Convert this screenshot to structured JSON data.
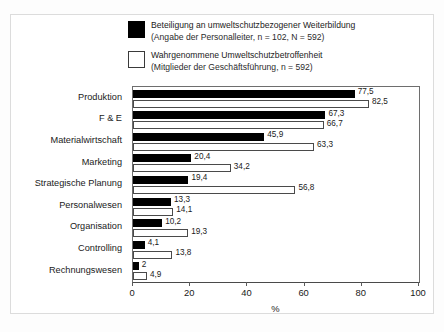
{
  "legend": {
    "items": [
      {
        "swatch": "black",
        "line1": "Beteiligung an umweltschutzbezogener Weiterbildung",
        "line2": "(Angabe der Personalleiter, n = 102, N = 592)"
      },
      {
        "swatch": "white",
        "line1": "Wahrgenommene Umweltschutzbetroffenheit",
        "line2": "(Mitglieder der Geschäftsführung, n = 592)"
      }
    ]
  },
  "chart_data": {
    "type": "bar",
    "orientation": "horizontal",
    "title": "",
    "subtitle": "",
    "xlabel": "%",
    "ylabel": "",
    "xlim": [
      0,
      100
    ],
    "xticks": [
      "0",
      "20",
      "40",
      "60",
      "80",
      "100"
    ],
    "grid": false,
    "legend_position": "top",
    "categories": [
      "Produktion",
      "F & E",
      "Materialwirtschaft",
      "Marketing",
      "Strategische Planung",
      "Personalwesen",
      "Organisation",
      "Controlling",
      "Rechnungswesen"
    ],
    "series": [
      {
        "name": "Beteiligung an umweltschutzbezogener Weiterbildung",
        "color": "#000000",
        "values": [
          77.5,
          67.3,
          45.9,
          20.4,
          19.4,
          13.3,
          10.2,
          4.1,
          2
        ],
        "labels": [
          "77,5",
          "67,3",
          "45,9",
          "20,4",
          "19,4",
          "13,3",
          "10,2",
          "4,1",
          "2"
        ]
      },
      {
        "name": "Wahrgenommene Umweltschutzbetroffenheit",
        "color": "#ffffff",
        "values": [
          82.5,
          66.7,
          63.3,
          34.2,
          56.8,
          14.1,
          19.3,
          13.8,
          4.9
        ],
        "labels": [
          "82,5",
          "66,7",
          "63,3",
          "34,2",
          "56,8",
          "14,1",
          "19,3",
          "13,8",
          "4,9"
        ]
      }
    ]
  }
}
